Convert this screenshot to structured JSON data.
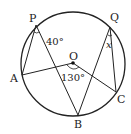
{
  "diagram": {
    "type": "circle-geometry",
    "circle": {
      "cx": 73,
      "cy": 64,
      "r": 52,
      "stroke": "#222222"
    },
    "center": {
      "label": "O",
      "x": 73,
      "y": 63
    },
    "points": {
      "P": {
        "label": "P",
        "x": 36,
        "y": 25
      },
      "Q": {
        "label": "Q",
        "x": 110,
        "y": 27
      },
      "A": {
        "label": "A",
        "x": 22,
        "y": 75
      },
      "B": {
        "label": "B",
        "x": 78,
        "y": 115
      },
      "C": {
        "label": "C",
        "x": 116,
        "y": 92
      }
    },
    "segments": [
      [
        "P",
        "A"
      ],
      [
        "P",
        "B"
      ],
      [
        "A",
        "O"
      ],
      [
        "O",
        "C"
      ],
      [
        "Q",
        "B"
      ],
      [
        "Q",
        "C"
      ]
    ],
    "angles": {
      "P": {
        "label": "40°"
      },
      "O": {
        "label": "130°"
      },
      "Q": {
        "label": "x"
      }
    }
  }
}
